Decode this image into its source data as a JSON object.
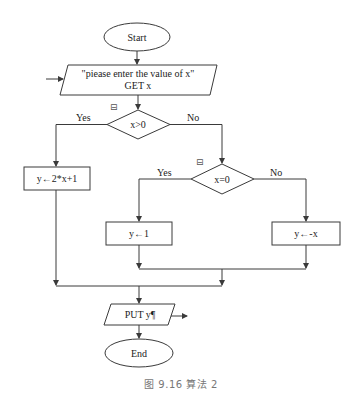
{
  "diagram": {
    "type": "flowchart",
    "nodes": {
      "start": {
        "shape": "ellipse",
        "label": "Start"
      },
      "input": {
        "shape": "parallelogram",
        "line1": "\"piease enter the value of x\"",
        "line2": "GET x"
      },
      "decision1": {
        "shape": "diamond",
        "label": "x>0",
        "yes_label": "Yes",
        "no_label": "No",
        "marker": "⊟"
      },
      "assign1": {
        "shape": "rect",
        "label": "y←2*x+1"
      },
      "decision2": {
        "shape": "diamond",
        "label": "x=0",
        "yes_label": "Yes",
        "no_label": "No",
        "marker": "⊟"
      },
      "assign2": {
        "shape": "rect",
        "label": "y←1"
      },
      "assign3": {
        "shape": "rect",
        "label": "y←-x"
      },
      "output": {
        "shape": "parallelogram",
        "label": "PUT y¶"
      },
      "end": {
        "shape": "ellipse",
        "label": "End"
      }
    },
    "edges": [
      {
        "from": "external",
        "to": "input"
      },
      {
        "from": "start",
        "to": "input"
      },
      {
        "from": "input",
        "to": "decision1"
      },
      {
        "from": "decision1",
        "to": "assign1",
        "label": "Yes"
      },
      {
        "from": "decision1",
        "to": "decision2",
        "label": "No"
      },
      {
        "from": "decision2",
        "to": "assign2",
        "label": "Yes"
      },
      {
        "from": "decision2",
        "to": "assign3",
        "label": "No"
      },
      {
        "from": "assign2",
        "to": "merge2"
      },
      {
        "from": "assign3",
        "to": "merge2"
      },
      {
        "from": "assign1",
        "to": "merge1"
      },
      {
        "from": "merge2",
        "to": "merge1"
      },
      {
        "from": "merge1",
        "to": "output"
      },
      {
        "from": "output",
        "to": "end"
      },
      {
        "from": "output",
        "to": "external"
      }
    ],
    "caption": "图 9.16   算法 2"
  }
}
